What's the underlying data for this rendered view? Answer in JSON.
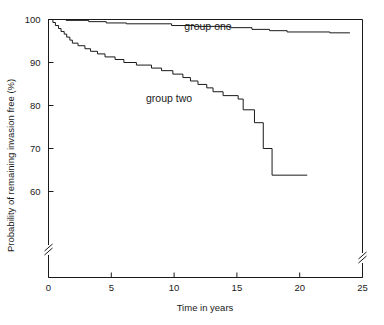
{
  "chart_data": {
    "type": "line",
    "title": "",
    "xlabel": "Time in years",
    "ylabel": "Probability of remaining invasion free (%)",
    "xlim": [
      0,
      25
    ],
    "ylim": [
      57,
      100
    ],
    "xticks": [
      "0",
      "5",
      "10",
      "15",
      "20",
      "25"
    ],
    "xtick_values": [
      0,
      5,
      10,
      15,
      20,
      25
    ],
    "yticks": [
      "100",
      "90",
      "80",
      "70",
      "60"
    ],
    "ytick_values": [
      100,
      90,
      80,
      70,
      60
    ],
    "grid": false,
    "legend_position": "inline-annotations",
    "y_axis_break": true,
    "x_axis_break": true,
    "series": [
      {
        "name": "group one",
        "label_text": "group one",
        "label_x": 12.7,
        "label_y": 97.6,
        "style": "step",
        "points": [
          [
            0.0,
            100.0
          ],
          [
            1.4,
            100.0
          ],
          [
            1.4,
            99.8
          ],
          [
            3.2,
            99.8
          ],
          [
            3.2,
            99.5
          ],
          [
            4.6,
            99.5
          ],
          [
            4.6,
            99.2
          ],
          [
            6.2,
            99.2
          ],
          [
            6.2,
            99.0
          ],
          [
            9.8,
            99.0
          ],
          [
            9.8,
            98.6
          ],
          [
            11.6,
            98.6
          ],
          [
            11.6,
            98.4
          ],
          [
            14.4,
            98.4
          ],
          [
            14.4,
            98.1
          ],
          [
            16.2,
            98.1
          ],
          [
            16.2,
            97.7
          ],
          [
            17.6,
            97.7
          ],
          [
            17.6,
            97.4
          ],
          [
            19.0,
            97.4
          ],
          [
            19.0,
            97.1
          ],
          [
            22.4,
            97.1
          ],
          [
            22.4,
            96.9
          ],
          [
            24.0,
            96.9
          ]
        ]
      },
      {
        "name": "group two",
        "label_text": "group two",
        "label_x": 9.6,
        "label_y": 80.8,
        "style": "step",
        "points": [
          [
            0.0,
            100.0
          ],
          [
            0.35,
            100.0
          ],
          [
            0.35,
            99.3
          ],
          [
            0.55,
            99.3
          ],
          [
            0.55,
            98.6
          ],
          [
            0.8,
            98.6
          ],
          [
            0.8,
            97.9
          ],
          [
            1.0,
            97.9
          ],
          [
            1.0,
            97.2
          ],
          [
            1.25,
            97.2
          ],
          [
            1.25,
            96.6
          ],
          [
            1.45,
            96.6
          ],
          [
            1.45,
            95.9
          ],
          [
            1.7,
            95.9
          ],
          [
            1.7,
            95.2
          ],
          [
            1.9,
            95.2
          ],
          [
            1.9,
            94.5
          ],
          [
            2.35,
            94.5
          ],
          [
            2.35,
            93.9
          ],
          [
            2.9,
            93.9
          ],
          [
            2.9,
            93.2
          ],
          [
            3.35,
            93.2
          ],
          [
            3.35,
            92.6
          ],
          [
            3.9,
            92.6
          ],
          [
            3.9,
            92.0
          ],
          [
            4.5,
            92.0
          ],
          [
            4.5,
            91.3
          ],
          [
            5.3,
            91.3
          ],
          [
            5.3,
            90.7
          ],
          [
            6.0,
            90.7
          ],
          [
            6.0,
            90.0
          ],
          [
            7.0,
            90.0
          ],
          [
            7.0,
            89.4
          ],
          [
            8.2,
            89.4
          ],
          [
            8.2,
            88.7
          ],
          [
            9.0,
            88.7
          ],
          [
            9.0,
            88.1
          ],
          [
            9.9,
            88.1
          ],
          [
            9.9,
            87.3
          ],
          [
            10.7,
            87.3
          ],
          [
            10.7,
            86.5
          ],
          [
            11.3,
            86.5
          ],
          [
            11.3,
            85.7
          ],
          [
            11.9,
            85.7
          ],
          [
            11.9,
            84.9
          ],
          [
            12.6,
            84.9
          ],
          [
            12.6,
            84.1
          ],
          [
            13.1,
            84.1
          ],
          [
            13.1,
            83.2
          ],
          [
            13.9,
            83.2
          ],
          [
            13.9,
            82.3
          ],
          [
            15.1,
            82.3
          ],
          [
            15.1,
            81.5
          ],
          [
            15.5,
            81.5
          ],
          [
            15.5,
            79.0
          ],
          [
            16.4,
            79.0
          ],
          [
            16.4,
            76.0
          ],
          [
            17.1,
            76.0
          ],
          [
            17.1,
            70.0
          ],
          [
            17.8,
            70.0
          ],
          [
            17.8,
            63.8
          ],
          [
            20.6,
            63.8
          ]
        ]
      }
    ]
  }
}
